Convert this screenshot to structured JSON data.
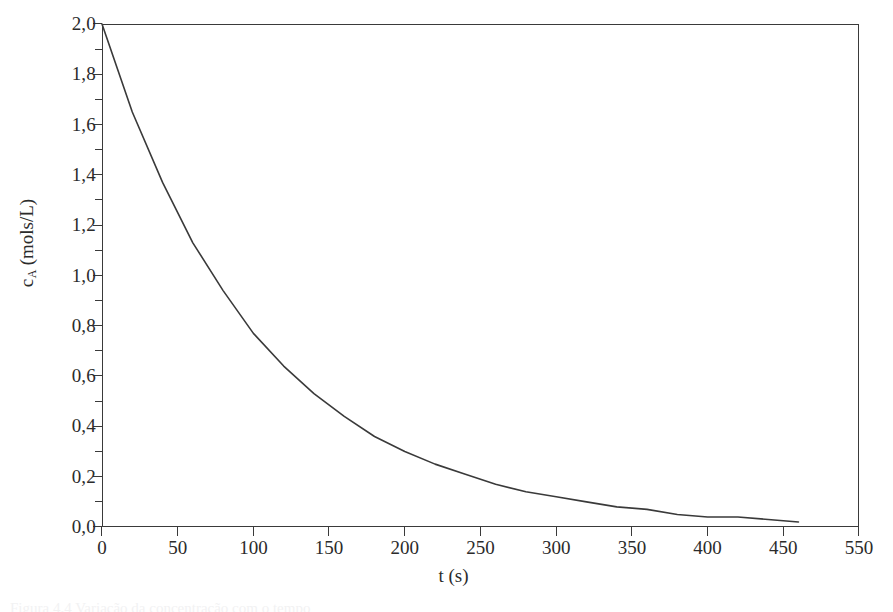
{
  "figure": {
    "caption": "Figura 4.4 Variação da concentração com o tempo"
  },
  "axes": {
    "y_title_main": "c",
    "y_title_sub": "A",
    "y_title_unit": " (mols/L)",
    "x_title": "t (s)",
    "y_ticklabels": [
      "0,0",
      "0,2",
      "0,4",
      "0,6",
      "0,8",
      "1,0",
      "1,2",
      "1,4",
      "1,6",
      "1,8",
      "2,0"
    ],
    "x_ticklabels": [
      "0",
      "50",
      "100",
      "150",
      "200",
      "250",
      "300",
      "350",
      "400",
      "450",
      "550"
    ]
  },
  "chart_data": {
    "type": "line",
    "title": "",
    "xlabel": "t (s)",
    "ylabel": "c_A (mols/L)",
    "xlim": [
      0,
      500
    ],
    "ylim": [
      0,
      2.0
    ],
    "grid": false,
    "legend": false,
    "y_major_step": 0.2,
    "y_minor_step": 0.1,
    "x_major_step": 50,
    "y_tick_values": [
      0.0,
      0.2,
      0.4,
      0.6,
      0.8,
      1.0,
      1.2,
      1.4,
      1.6,
      1.8,
      2.0
    ],
    "y_tick_labels": [
      "0,0",
      "0,2",
      "0,4",
      "0,6",
      "0,8",
      "1,0",
      "1,2",
      "1,4",
      "1,6",
      "1,8",
      "2,0"
    ],
    "x_tick_values": [
      0,
      50,
      100,
      150,
      200,
      250,
      300,
      350,
      400,
      450,
      500
    ],
    "x_tick_labels": [
      "0",
      "50",
      "100",
      "150",
      "200",
      "250",
      "300",
      "350",
      "400",
      "450",
      "550"
    ],
    "x_tick_label_note": "final tick sits at the x=500 position but is printed as 550 in the source figure",
    "series": [
      {
        "name": "c_A",
        "color": "#3a3a3a",
        "model": "c_A(t) = 2.0 * exp(-0.0095 * t)",
        "x": [
          0,
          20,
          40,
          60,
          80,
          100,
          120,
          140,
          160,
          180,
          200,
          220,
          240,
          260,
          280,
          300,
          320,
          340,
          360,
          380,
          400,
          420,
          440,
          460
        ],
        "values": [
          2.0,
          1.65,
          1.37,
          1.13,
          0.94,
          0.77,
          0.64,
          0.53,
          0.44,
          0.36,
          0.3,
          0.25,
          0.21,
          0.17,
          0.14,
          0.12,
          0.1,
          0.08,
          0.07,
          0.05,
          0.04,
          0.04,
          0.03,
          0.02
        ]
      }
    ]
  }
}
